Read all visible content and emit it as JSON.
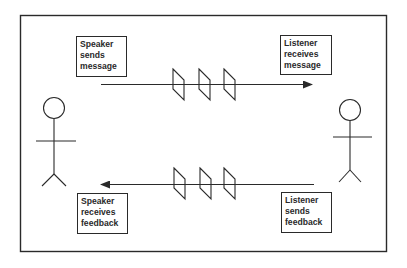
{
  "diagram": {
    "title": "",
    "participants": [
      {
        "id": "speaker",
        "role": "Speaker",
        "icon": "stick-figure-icon"
      },
      {
        "id": "listener",
        "role": "Listener",
        "icon": "stick-figure-icon"
      }
    ],
    "boxes": {
      "speaker_sends": [
        "Speaker",
        "sends",
        "message"
      ],
      "listener_receives": [
        "Listener",
        "receives",
        "message"
      ],
      "speaker_receives": [
        "Speaker",
        "receives",
        "feedback"
      ],
      "listener_sends": [
        "Listener",
        "sends",
        "feedback"
      ]
    },
    "flows": [
      {
        "from": "speaker",
        "to": "listener",
        "label": "message",
        "barriers": 3
      },
      {
        "from": "listener",
        "to": "speaker",
        "label": "feedback",
        "barriers": 3
      }
    ],
    "colors": {
      "line": "#2a2a2a",
      "background": "#ffffff"
    }
  }
}
